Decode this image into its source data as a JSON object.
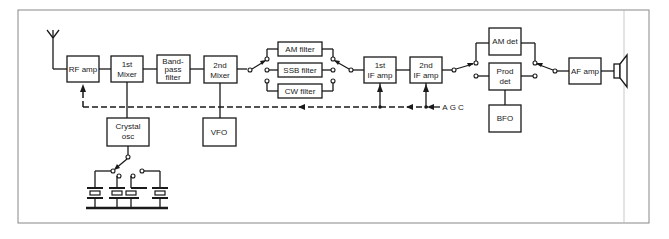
{
  "diagram": {
    "blocks": {
      "rf_amp": "RF amp",
      "mixer1": [
        "1st",
        "Mixer"
      ],
      "bandpass": [
        "Band-",
        "pass",
        "filter"
      ],
      "mixer2": [
        "2nd",
        "Mixer"
      ],
      "am_filter": "AM filter",
      "ssb_filter": "SSB filter",
      "cw_filter": "CW filter",
      "if_amp1": [
        "1st",
        "IF amp"
      ],
      "if_amp2": [
        "2nd",
        "IF amp"
      ],
      "am_det": "AM det",
      "prod_det": [
        "Prod",
        "det"
      ],
      "bfo": "BFO",
      "af_amp": "AF amp",
      "crystal_osc": [
        "Crystal",
        "osc"
      ],
      "vfo": "VFO"
    },
    "labels": {
      "agc": "AGC"
    },
    "colors": {
      "line": "#1a1a1a",
      "frame": "#888888",
      "background": "#ffffff"
    }
  }
}
